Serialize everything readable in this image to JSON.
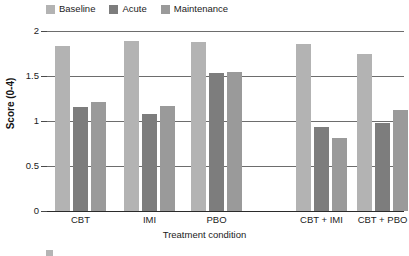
{
  "chart_data": {
    "type": "bar",
    "title": "",
    "xlabel": "Treatment condition",
    "ylabel": "Score (0-4)",
    "ylim": [
      0,
      2
    ],
    "yticks": [
      "0",
      "0.5",
      "1",
      "1.5",
      "2"
    ],
    "ytick_values": [
      0,
      0.5,
      1,
      1.5,
      2
    ],
    "grid": true,
    "legend_position": "top-left",
    "categories": [
      "CBT",
      "IMI",
      "PBO",
      "CBT + IMI",
      "CBT + PBO"
    ],
    "series": [
      {
        "name": "Baseline",
        "color": "#b3b3b3",
        "values": [
          1.83,
          1.89,
          1.88,
          1.86,
          1.75
        ]
      },
      {
        "name": "Acute",
        "color": "#7d7d7d",
        "values": [
          1.16,
          1.08,
          1.53,
          0.93,
          0.98
        ]
      },
      {
        "name": "Maintenance",
        "color": "#9a9a9a",
        "values": [
          1.21,
          1.17,
          1.55,
          0.81,
          1.12
        ]
      }
    ]
  },
  "legend": {
    "items": [
      {
        "label": "Baseline",
        "swatch": "legend-swatch-baseline"
      },
      {
        "label": "Acute",
        "swatch": "legend-swatch-acute"
      },
      {
        "label": "Maintenance",
        "swatch": "legend-swatch-maintenance"
      }
    ]
  },
  "axes": {
    "y_title": "Score (0-4)",
    "x_title": "Treatment condition",
    "y_tick_labels": [
      "2",
      "1.5",
      "1",
      "0.5",
      "0"
    ],
    "x_group_labels": [
      "CBT",
      "IMI",
      "PBO",
      "CBT + IMI",
      "CBT + PBO"
    ]
  },
  "caption": {
    "text": ""
  },
  "colors": {
    "baseline": "#b3b3b3",
    "acute": "#7d7d7d",
    "maintenance": "#9a9a9a",
    "gridline": "#6d6d6d",
    "axis": "#2b2b2b",
    "text": "#1b1b1b",
    "background": "#ffffff"
  }
}
